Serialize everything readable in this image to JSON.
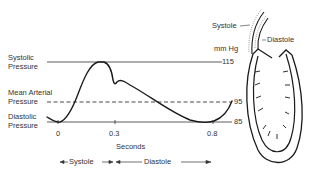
{
  "labels": {
    "systolic": [
      "Systolic",
      "Pressure"
    ],
    "mean": [
      "Mean Arterial",
      "Pressure"
    ],
    "diastolic": [
      "Diastolic",
      "Pressure"
    ],
    "unit": "mm Hg",
    "xaxis": "Seconds",
    "heart_systole": "Systole",
    "heart_diastole": "Diastole",
    "phase_systole": "Systole",
    "phase_diastole": "Diastole"
  },
  "values": {
    "systolic": "115",
    "mean": "95",
    "diastolic": "85"
  },
  "ticks": [
    "0",
    "0.3",
    "0.8"
  ],
  "colors": {
    "ink": "#1a1a1a",
    "text": "#333333"
  }
}
